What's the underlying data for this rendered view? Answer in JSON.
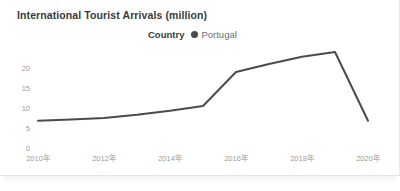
{
  "chart_data": {
    "type": "line",
    "title": "International Tourist Arrivals (million)",
    "xlabel": "",
    "ylabel": "",
    "grid": false,
    "legend_position": "top-center",
    "legend_title": "Country",
    "series": [
      {
        "name": "Portugal",
        "color": "#4a4a4f",
        "x": [
          2010,
          2011,
          2012,
          2013,
          2014,
          2015,
          2016,
          2017,
          2018,
          2019,
          2020
        ],
        "values": [
          6.8,
          7.1,
          7.5,
          8.3,
          9.3,
          10.5,
          19.0,
          21.0,
          22.8,
          24.0,
          6.8
        ]
      }
    ],
    "xtick_labels": [
      "2010年",
      "2012年",
      "2014年",
      "2016年",
      "2018年",
      "2020年"
    ],
    "xtick_values": [
      2010,
      2012,
      2014,
      2016,
      2018,
      2020
    ],
    "ytick_labels": [
      "0",
      "5",
      "10",
      "15",
      "20"
    ],
    "ytick_values": [
      0,
      5,
      10,
      15,
      20
    ],
    "xlim": [
      2010,
      2020
    ],
    "ylim": [
      0,
      24.8
    ]
  },
  "legend": {
    "title": "Country",
    "entries": [
      {
        "label": "Portugal",
        "marker": "circle-marker"
      }
    ]
  },
  "colors": {
    "line": "#4a4a4f",
    "tick_text": "#9a9aa0",
    "title_text": "#3a3a40",
    "background": "#ffffff"
  }
}
